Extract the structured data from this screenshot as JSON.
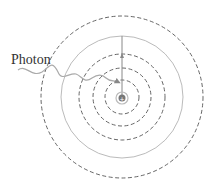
{
  "diagram": {
    "labels": {
      "photon": "Photon"
    },
    "orbits": [
      {
        "level": 1,
        "style": "dashed"
      },
      {
        "level": 2,
        "style": "dashed"
      },
      {
        "level": 3,
        "style": "dashed"
      },
      {
        "level": 4,
        "style": "solid"
      },
      {
        "level": 5,
        "style": "dashed"
      }
    ],
    "nucleus": {
      "symbol": "+"
    },
    "transition": {
      "from_level": 2,
      "to_level": 4
    },
    "colors": {
      "dashed_orbit": "#555555",
      "solid_orbit": "#bbbbbb",
      "photon_wave": "#aaaaaa",
      "nucleus": "#777777",
      "text": "#333333"
    }
  }
}
